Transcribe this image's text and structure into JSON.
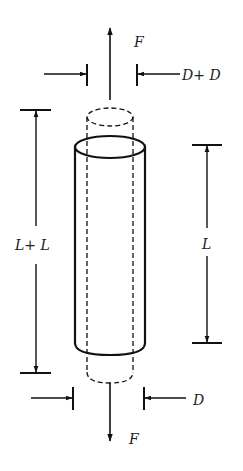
{
  "diagram": {
    "labels": {
      "force_top": "F",
      "force_bottom": "F",
      "diameter_top": "D+ D",
      "diameter_bottom": "D",
      "length_left": "L+ L",
      "length_right": "L"
    },
    "colors": {
      "stroke": "#111111",
      "background": "#ffffff"
    }
  }
}
